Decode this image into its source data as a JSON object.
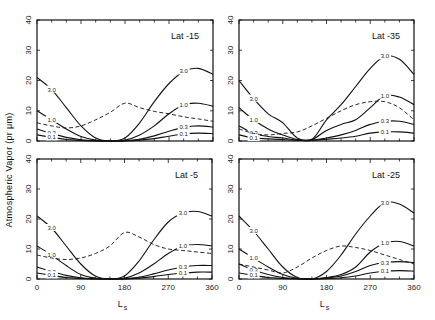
{
  "figure": {
    "ylabel": "Atmospheric Vapor  (pr μm)",
    "xlabel": "L",
    "xlabel_sub": "s"
  },
  "chart_data": [
    {
      "type": "line",
      "panel": "top-left",
      "title": "Lat -15",
      "xlabel": "Ls",
      "ylabel": "Atmospheric Vapor (pr μm)",
      "xlim": [
        0,
        360
      ],
      "ylim": [
        0,
        40
      ],
      "xticks": [
        0,
        90,
        180,
        270,
        360
      ],
      "yticks": [
        0,
        10,
        20,
        30,
        40
      ],
      "x": [
        0,
        30,
        60,
        90,
        120,
        150,
        180,
        210,
        240,
        270,
        300,
        330,
        360
      ],
      "series": [
        {
          "name": "3.0",
          "style": "solid",
          "values": [
            21,
            17,
            11,
            5,
            1,
            0,
            1,
            6,
            13,
            19,
            23,
            24,
            22
          ]
        },
        {
          "name": "1.0",
          "style": "solid",
          "values": [
            10,
            7,
            4,
            1.5,
            0.3,
            0,
            0.3,
            2,
            5,
            9,
            12,
            12.5,
            11.5
          ]
        },
        {
          "name": "0.3",
          "style": "solid",
          "values": [
            4,
            2.5,
            1.2,
            0.4,
            0.1,
            0,
            0.1,
            0.6,
            1.7,
            3.2,
            4.5,
            5,
            4.6
          ]
        },
        {
          "name": "0.1",
          "style": "solid",
          "values": [
            2,
            1.2,
            0.5,
            0.2,
            0,
            0,
            0,
            0.3,
            0.8,
            1.6,
            2.3,
            2.6,
            2.4
          ]
        },
        {
          "name": "dashed",
          "style": "dashed",
          "values": [
            6,
            5,
            4.3,
            5,
            7,
            9.5,
            12.5,
            11,
            9.8,
            9,
            8,
            7.3,
            6.5
          ]
        }
      ]
    },
    {
      "type": "line",
      "panel": "top-right",
      "title": "Lat -35",
      "xlabel": "Ls",
      "ylabel": "Atmospheric Vapor (pr μm)",
      "xlim": [
        0,
        360
      ],
      "ylim": [
        0,
        40
      ],
      "xticks": [
        0,
        90,
        180,
        270,
        360
      ],
      "yticks": [
        0,
        10,
        20,
        30,
        40
      ],
      "x": [
        0,
        30,
        60,
        90,
        120,
        150,
        180,
        210,
        240,
        270,
        300,
        330,
        360
      ],
      "series": [
        {
          "name": "3.0",
          "style": "solid",
          "values": [
            20,
            14,
            9,
            6,
            1,
            0.5,
            7,
            12,
            18,
            24,
            28,
            27,
            22
          ]
        },
        {
          "name": "1.0",
          "style": "solid",
          "values": [
            11,
            7,
            4,
            2,
            0.5,
            0.5,
            3.5,
            5.5,
            7,
            11,
            15,
            14.5,
            12
          ]
        },
        {
          "name": "0.3",
          "style": "solid",
          "values": [
            5,
            2.5,
            1.5,
            1,
            0.3,
            0.3,
            1,
            2,
            3.5,
            5.5,
            6.5,
            6.5,
            5.5
          ]
        },
        {
          "name": "0.1",
          "style": "solid",
          "values": [
            2,
            1,
            0.7,
            0.5,
            0.2,
            0.2,
            0.6,
            1,
            1.6,
            2.6,
            3,
            3,
            2.6
          ]
        },
        {
          "name": "dashed",
          "style": "dashed",
          "values": [
            4,
            2.5,
            2,
            2.5,
            3,
            5,
            7.5,
            10,
            12,
            13,
            13,
            11,
            7
          ]
        }
      ]
    },
    {
      "type": "line",
      "panel": "bottom-left",
      "title": "Lat -5",
      "xlabel": "Ls",
      "ylabel": "Atmospheric Vapor (pr μm)",
      "xlim": [
        0,
        360
      ],
      "ylim": [
        0,
        40
      ],
      "xticks": [
        0,
        90,
        180,
        270,
        360
      ],
      "yticks": [
        0,
        10,
        20,
        30,
        40
      ],
      "x": [
        0,
        30,
        60,
        90,
        120,
        150,
        180,
        210,
        240,
        270,
        300,
        330,
        360
      ],
      "series": [
        {
          "name": "3.0",
          "style": "solid",
          "values": [
            21,
            17,
            11,
            5,
            1,
            0,
            1,
            6,
            13,
            19,
            22,
            22.5,
            21
          ]
        },
        {
          "name": "1.0",
          "style": "solid",
          "values": [
            11,
            8,
            4.5,
            1.5,
            0.3,
            0,
            0.3,
            2,
            5,
            8.5,
            11,
            11.5,
            11
          ]
        },
        {
          "name": "0.3",
          "style": "solid",
          "values": [
            4,
            2.5,
            1.2,
            0.4,
            0.1,
            0,
            0.1,
            0.6,
            1.7,
            3,
            4,
            4.5,
            4.5
          ]
        },
        {
          "name": "0.1",
          "style": "solid",
          "values": [
            2,
            1.2,
            0.5,
            0.2,
            0,
            0,
            0,
            0.3,
            0.8,
            1.5,
            2,
            2.3,
            2.3
          ]
        },
        {
          "name": "dashed",
          "style": "dashed",
          "values": [
            8,
            7,
            6.5,
            7,
            8.5,
            11,
            15.5,
            14,
            11.5,
            10,
            9.5,
            9,
            8.5
          ]
        }
      ]
    },
    {
      "type": "line",
      "panel": "bottom-right",
      "title": "Lat -25",
      "xlabel": "Ls",
      "ylabel": "Atmospheric Vapor (pr μm)",
      "xlim": [
        0,
        360
      ],
      "ylim": [
        0,
        40
      ],
      "xticks": [
        0,
        90,
        180,
        270,
        360
      ],
      "yticks": [
        0,
        10,
        20,
        30,
        40
      ],
      "x": [
        0,
        30,
        60,
        90,
        120,
        150,
        180,
        210,
        240,
        270,
        300,
        330,
        360
      ],
      "series": [
        {
          "name": "3.0",
          "style": "solid",
          "values": [
            21,
            16,
            10,
            4,
            0.5,
            0,
            2.5,
            8,
            15,
            21,
            25.5,
            25,
            22
          ]
        },
        {
          "name": "1.0",
          "style": "solid",
          "values": [
            10,
            7,
            4,
            1.5,
            0.2,
            0,
            0.5,
            1.5,
            4,
            9,
            12,
            12.5,
            11
          ]
        },
        {
          "name": "0.3",
          "style": "solid",
          "values": [
            5,
            3,
            1.5,
            0.5,
            0.1,
            0,
            0.3,
            1,
            2.5,
            4.5,
            5.5,
            5.8,
            5.5
          ]
        },
        {
          "name": "0.1",
          "style": "solid",
          "values": [
            2,
            1.2,
            0.5,
            0.2,
            0,
            0,
            0.1,
            0.4,
            1,
            2,
            2.6,
            2.8,
            2.6
          ]
        },
        {
          "name": "dashed",
          "style": "dashed",
          "values": [
            5,
            4,
            3,
            2,
            4,
            7,
            9.5,
            11,
            10.5,
            9.5,
            8,
            6.5,
            5
          ]
        }
      ]
    }
  ]
}
